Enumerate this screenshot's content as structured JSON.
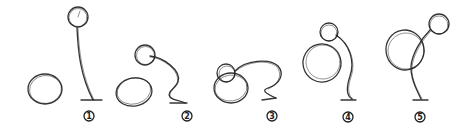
{
  "figure": {
    "stroke_color": "#1e1e1e",
    "background": "#ffffff",
    "stages": [
      {
        "label": "1"
      },
      {
        "label": "2"
      },
      {
        "label": "3"
      },
      {
        "label": "4"
      },
      {
        "label": "5"
      }
    ]
  }
}
